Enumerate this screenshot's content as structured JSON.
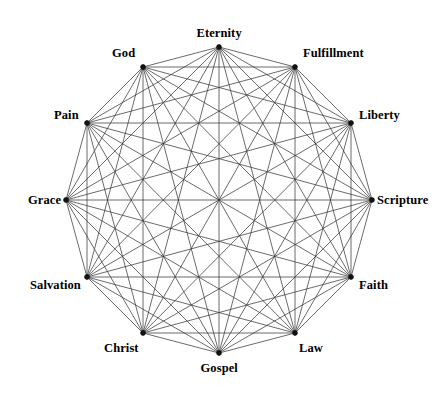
{
  "diagram": {
    "type": "complete-graph",
    "node_count": 12,
    "edge_count": 66,
    "layout": "circular",
    "center": {
      "x": 219,
      "y": 200
    },
    "radius": 153,
    "start_angle_deg": -90,
    "angle_step_deg": 30,
    "colors": {
      "background": "#ffffff",
      "edge": "#3a3a3a",
      "node": "#111111",
      "label": "#000000"
    },
    "nodes": [
      {
        "id": "eternity",
        "label": "Eternity",
        "angle_deg": -90,
        "x": 219,
        "y": 47,
        "label_x": 219,
        "label_y": 33,
        "label_anchor": "center"
      },
      {
        "id": "fulfillment",
        "label": "Fulfillment",
        "angle_deg": -60,
        "x": 295,
        "y": 67,
        "label_x": 303,
        "label_y": 53,
        "label_anchor": "left"
      },
      {
        "id": "liberty",
        "label": "Liberty",
        "angle_deg": -30,
        "x": 351,
        "y": 123,
        "label_x": 359,
        "label_y": 115,
        "label_anchor": "left"
      },
      {
        "id": "scripture",
        "label": "Scripture",
        "angle_deg": 0,
        "x": 372,
        "y": 200,
        "label_x": 377,
        "label_y": 200,
        "label_anchor": "left"
      },
      {
        "id": "faith",
        "label": "Faith",
        "angle_deg": 30,
        "x": 351,
        "y": 277,
        "label_x": 359,
        "label_y": 285,
        "label_anchor": "left"
      },
      {
        "id": "law",
        "label": "Law",
        "angle_deg": 60,
        "x": 295,
        "y": 333,
        "label_x": 299,
        "label_y": 348,
        "label_anchor": "left"
      },
      {
        "id": "gospel",
        "label": "Gospel",
        "angle_deg": 90,
        "x": 219,
        "y": 353,
        "label_x": 219,
        "label_y": 368,
        "label_anchor": "center"
      },
      {
        "id": "christ",
        "label": "Christ",
        "angle_deg": 120,
        "x": 143,
        "y": 333,
        "label_x": 139,
        "label_y": 348,
        "label_anchor": "right"
      },
      {
        "id": "salvation",
        "label": "Salvation",
        "angle_deg": 150,
        "x": 87,
        "y": 277,
        "label_x": 81,
        "label_y": 285,
        "label_anchor": "right"
      },
      {
        "id": "grace",
        "label": "Grace",
        "angle_deg": 180,
        "x": 66,
        "y": 200,
        "label_x": 61,
        "label_y": 200,
        "label_anchor": "right"
      },
      {
        "id": "pain",
        "label": "Pain",
        "angle_deg": 210,
        "x": 87,
        "y": 123,
        "label_x": 79,
        "label_y": 115,
        "label_anchor": "right"
      },
      {
        "id": "god",
        "label": "God",
        "angle_deg": 240,
        "x": 143,
        "y": 67,
        "label_x": 135,
        "label_y": 53,
        "label_anchor": "right"
      }
    ]
  }
}
